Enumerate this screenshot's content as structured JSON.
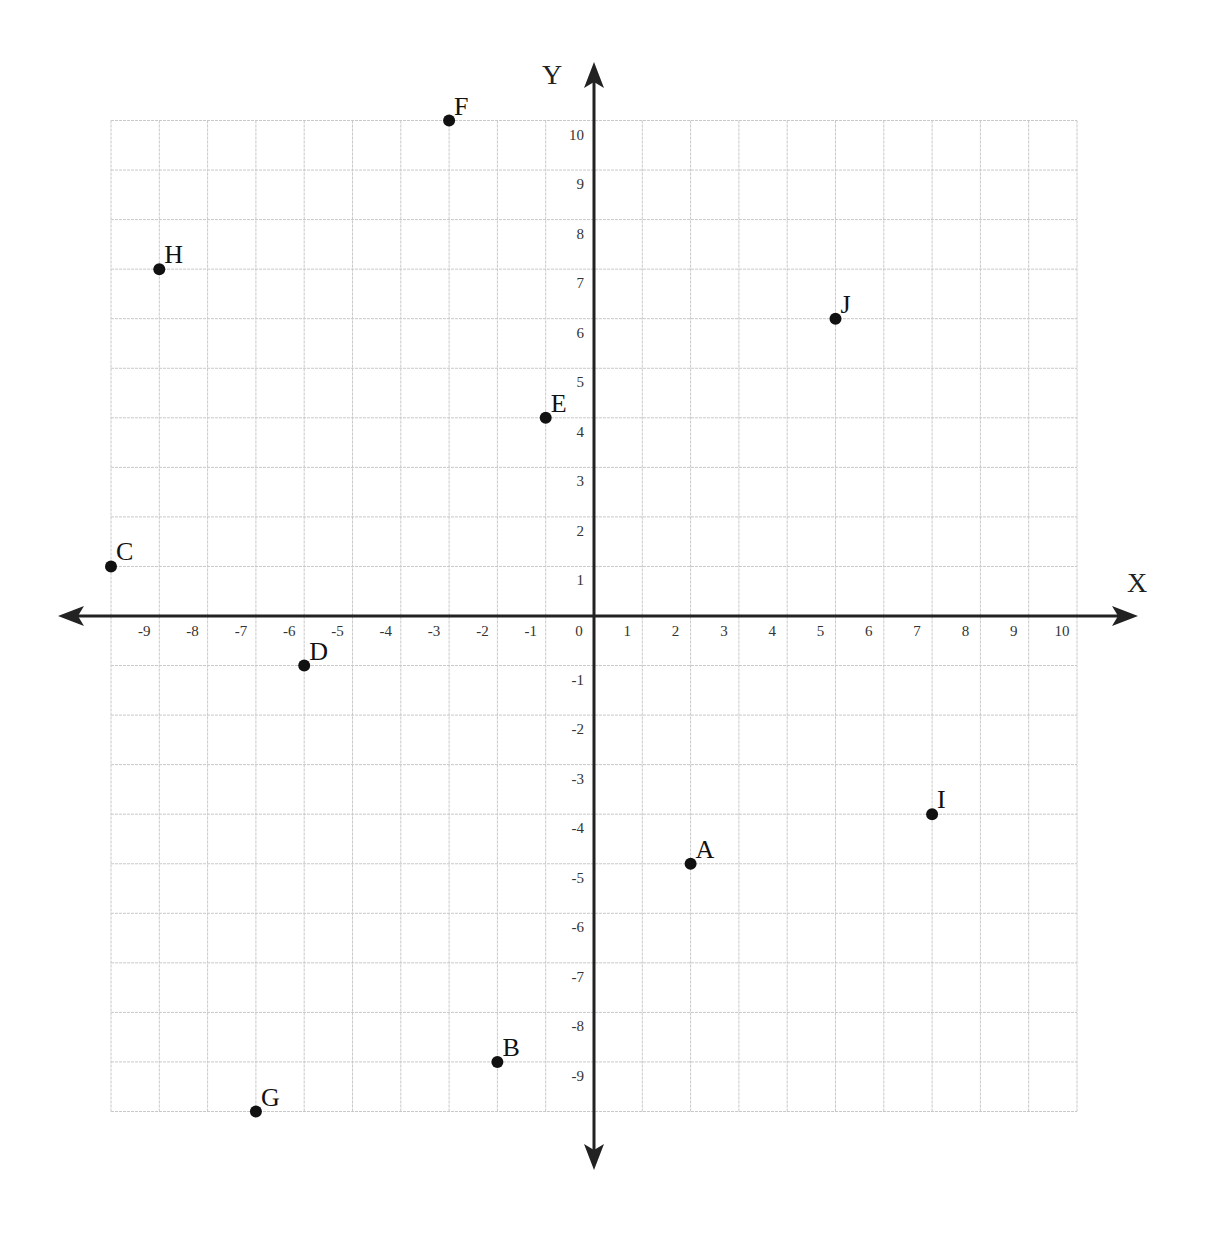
{
  "chart_data": {
    "type": "scatter",
    "title": "",
    "xlabel": "X",
    "ylabel": "Y",
    "xlim": [
      -10,
      10
    ],
    "ylim": [
      -10,
      10
    ],
    "grid": true,
    "x_ticks": [
      "-9",
      "-8",
      "-7",
      "-6",
      "-5",
      "-4",
      "-3",
      "-2",
      "-1",
      "0",
      "1",
      "2",
      "3",
      "4",
      "5",
      "6",
      "7",
      "8",
      "9",
      "10"
    ],
    "y_ticks": [
      "10",
      "9",
      "8",
      "7",
      "6",
      "5",
      "4",
      "3",
      "2",
      "1",
      "-1",
      "-2",
      "-3",
      "-4",
      "-5",
      "-6",
      "-7",
      "-8",
      "-9"
    ],
    "points": [
      {
        "label": "A",
        "x": 2,
        "y": -5
      },
      {
        "label": "B",
        "x": -2,
        "y": -9
      },
      {
        "label": "C",
        "x": -10,
        "y": 1
      },
      {
        "label": "D",
        "x": -6,
        "y": -1
      },
      {
        "label": "E",
        "x": -1,
        "y": 4
      },
      {
        "label": "F",
        "x": -3,
        "y": 10
      },
      {
        "label": "G",
        "x": -7,
        "y": -10
      },
      {
        "label": "H",
        "x": -9,
        "y": 7
      },
      {
        "label": "I",
        "x": 7,
        "y": -4
      },
      {
        "label": "J",
        "x": 5,
        "y": 6
      }
    ]
  },
  "axes": {
    "x_name": "X",
    "y_name": "Y"
  },
  "colors": {
    "grid": "#c8c8c8",
    "axis": "#222222",
    "point": "#111111"
  }
}
